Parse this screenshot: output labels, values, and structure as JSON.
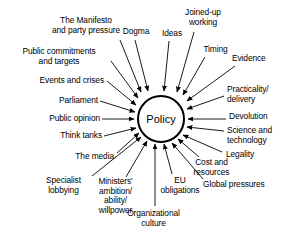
{
  "diagram": {
    "type": "radial-influence-diagram",
    "center": {
      "label": "Policy",
      "shape": "circle",
      "cx": 161,
      "cy": 119,
      "r": 23,
      "stroke": "#000000",
      "fill": "#ffffff"
    },
    "style": {
      "arrow_color": "#000000",
      "text_color": "#000000",
      "background": "#ffffff",
      "arrow_direction": "inward"
    },
    "factors": [
      {
        "id": "the-manifesto-and-party-pressure",
        "label": "The Manifesto\nand party pressure",
        "align": "center",
        "x": 38,
        "y": 16,
        "w": 96,
        "arrow": {
          "x1": 120,
          "y1": 40,
          "x2": 141,
          "y2": 92
        }
      },
      {
        "id": "dogma",
        "label": "Dogma",
        "align": "center",
        "x": 119,
        "y": 27,
        "w": 34,
        "arrow": {
          "x1": 135,
          "y1": 40,
          "x2": 148,
          "y2": 91
        }
      },
      {
        "id": "ideas",
        "label": "Ideas",
        "align": "center",
        "x": 158,
        "y": 29,
        "w": 28,
        "arrow": {
          "x1": 169,
          "y1": 41,
          "x2": 164,
          "y2": 91
        }
      },
      {
        "id": "joined-up-working",
        "label": "Joined-up\nworking",
        "align": "center",
        "x": 177,
        "y": 8,
        "w": 52,
        "arrow": {
          "x1": 194,
          "y1": 32,
          "x2": 177,
          "y2": 92
        }
      },
      {
        "id": "timing",
        "label": "Timing",
        "align": "center",
        "x": 199,
        "y": 45,
        "w": 33,
        "arrow": {
          "x1": 205,
          "y1": 57,
          "x2": 183,
          "y2": 95
        }
      },
      {
        "id": "evidence",
        "label": "Evidence",
        "align": "left",
        "x": 232,
        "y": 54,
        "w": 50,
        "arrow": {
          "x1": 235,
          "y1": 66,
          "x2": 187,
          "y2": 101
        }
      },
      {
        "id": "practicality-delivery",
        "label": "Practicality/\ndelivery",
        "align": "left",
        "x": 227,
        "y": 85,
        "w": 58,
        "arrow": {
          "x1": 224,
          "y1": 96,
          "x2": 187,
          "y2": 109
        }
      },
      {
        "id": "devolution",
        "label": "Devolution",
        "align": "left",
        "x": 229,
        "y": 112,
        "w": 57,
        "arrow": {
          "x1": 226,
          "y1": 119,
          "x2": 188,
          "y2": 119
        }
      },
      {
        "id": "science-and-technology",
        "label": "Science and\ntechnology",
        "align": "left",
        "x": 227,
        "y": 126,
        "w": 58,
        "arrow": {
          "x1": 224,
          "y1": 131,
          "x2": 187,
          "y2": 127
        }
      },
      {
        "id": "legality",
        "label": "Legality",
        "align": "left",
        "x": 226,
        "y": 150,
        "w": 44,
        "arrow": {
          "x1": 222,
          "y1": 152,
          "x2": 183,
          "y2": 135
        }
      },
      {
        "id": "cost-and-resources",
        "label": "Cost and\nresources",
        "align": "center",
        "x": 185,
        "y": 158,
        "w": 53,
        "arrow": {
          "x1": 199,
          "y1": 157,
          "x2": 178,
          "y2": 139
        }
      },
      {
        "id": "global-pressures",
        "label": "Global pressures",
        "align": "left",
        "x": 203,
        "y": 180,
        "w": 84,
        "arrow": {
          "x1": 203,
          "y1": 179,
          "x2": 172,
          "y2": 143
        }
      },
      {
        "id": "eu-obligations",
        "label": "EU\nobligations",
        "align": "center",
        "x": 152,
        "y": 176,
        "w": 56,
        "arrow": {
          "x1": 172,
          "y1": 174,
          "x2": 164,
          "y2": 144
        }
      },
      {
        "id": "organizational-culture",
        "label": "Organizational\nculture",
        "align": "center",
        "x": 116,
        "y": 209,
        "w": 75,
        "arrow": {
          "x1": 155,
          "y1": 206,
          "x2": 155,
          "y2": 144
        }
      },
      {
        "id": "ministers-ambition-ability-willpower",
        "label": "Ministers'\nambition/\nability/\nwillpower",
        "align": "center",
        "x": 88,
        "y": 177,
        "w": 55,
        "arrow": {
          "x1": 126,
          "y1": 177,
          "x2": 147,
          "y2": 141
        }
      },
      {
        "id": "specialist-lobbying",
        "label": "Specialist\nlobbying",
        "align": "center",
        "x": 37,
        "y": 176,
        "w": 53,
        "arrow": {
          "x1": 92,
          "y1": 176,
          "x2": 141,
          "y2": 137
        }
      },
      {
        "id": "the-media",
        "label": "The media",
        "align": "right",
        "x": 58,
        "y": 152,
        "w": 56,
        "arrow": {
          "x1": 117,
          "y1": 153,
          "x2": 139,
          "y2": 133
        }
      },
      {
        "id": "think-tanks",
        "label": "Think tanks",
        "align": "right",
        "x": 40,
        "y": 131,
        "w": 62,
        "arrow": {
          "x1": 104,
          "y1": 136,
          "x2": 136,
          "y2": 128
        }
      },
      {
        "id": "public-opinion",
        "label": "Public opinion",
        "align": "right",
        "x": 25,
        "y": 114,
        "w": 75,
        "arrow": {
          "x1": 102,
          "y1": 119,
          "x2": 134,
          "y2": 119
        }
      },
      {
        "id": "parliament",
        "label": "Parliament",
        "align": "right",
        "x": 36,
        "y": 96,
        "w": 62,
        "arrow": {
          "x1": 100,
          "y1": 101,
          "x2": 135,
          "y2": 112
        }
      },
      {
        "id": "events-and-crises",
        "label": "Events and crises",
        "align": "right",
        "x": 16,
        "y": 76,
        "w": 88,
        "arrow": {
          "x1": 107,
          "y1": 81,
          "x2": 136,
          "y2": 105
        }
      },
      {
        "id": "public-commitments-and-targets",
        "label": "Public commitments\nand targets",
        "align": "center",
        "x": 10,
        "y": 47,
        "w": 98,
        "arrow": {
          "x1": 111,
          "y1": 61,
          "x2": 138,
          "y2": 98
        }
      }
    ]
  }
}
